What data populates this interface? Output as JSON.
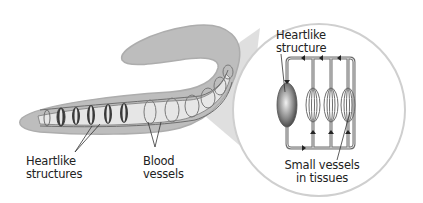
{
  "diagram": {
    "labels": {
      "heartlike_structures": [
        "Heartlike",
        "structures"
      ],
      "blood_vessels": [
        "Blood",
        "vessels"
      ],
      "heartlike_structure": [
        "Heartlike",
        "structure"
      ],
      "small_vessels": [
        "Small vessels",
        "in tissues"
      ]
    },
    "colors": {
      "worm_body": "#bdbdbd",
      "worm_edge": "#a9a9a9",
      "vessel": "#6e6e6e",
      "heart_dark": "#3a3a3a",
      "magnifier_circle": "#d0d0d0",
      "magnifier_cone": "#d9d9d9"
    }
  }
}
